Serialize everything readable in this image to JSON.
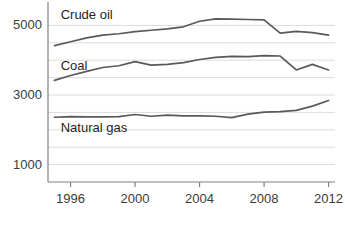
{
  "chart_data": {
    "type": "line",
    "title": "",
    "subtitle": "",
    "xlabel": "",
    "ylabel": "",
    "xlim": [
      1994.6,
      2012.4
    ],
    "ylim": [
      500,
      5500
    ],
    "xticks": [
      1996,
      2000,
      2004,
      2008,
      2012
    ],
    "xtick_labels": [
      "1996",
      "2000",
      "2004",
      "2008",
      "2012"
    ],
    "yticks": [
      1000,
      3000,
      5000
    ],
    "ytick_labels": [
      "1000",
      "3000",
      "5000"
    ],
    "gridlines_y": [
      1000,
      1500,
      2000,
      2500,
      3000,
      3500,
      4000,
      4500,
      5000
    ],
    "grid": true,
    "grid_color": "#dcdcdc",
    "legend": "inline-labels",
    "legend_position": "inside-left",
    "axis_color": "#808080",
    "line_color": "#595959",
    "background": "#ffffff",
    "x": [
      1995,
      1996,
      1997,
      1998,
      1999,
      2000,
      2001,
      2002,
      2003,
      2004,
      2005,
      2006,
      2007,
      2008,
      2009,
      2010,
      2011,
      2012
    ],
    "series": [
      {
        "name": "Crude oil",
        "label": "Crude oil",
        "values": [
          4420,
          4530,
          4640,
          4720,
          4760,
          4820,
          4860,
          4900,
          4960,
          5120,
          5190,
          5180,
          5170,
          5160,
          4780,
          4830,
          4790,
          4720
        ]
      },
      {
        "name": "Coal",
        "label": "Coal",
        "values": [
          3420,
          3560,
          3680,
          3790,
          3840,
          3960,
          3860,
          3880,
          3930,
          4020,
          4080,
          4110,
          4100,
          4130,
          4120,
          3720,
          3880,
          3720
        ]
      },
      {
        "name": "Natural gas",
        "label": "Natural gas",
        "values": [
          2360,
          2380,
          2370,
          2370,
          2380,
          2440,
          2390,
          2420,
          2400,
          2400,
          2390,
          2350,
          2450,
          2510,
          2520,
          2560,
          2680,
          2840
        ]
      }
    ],
    "annotations": [
      {
        "text": "Crude oil",
        "x": 1995.2,
        "y": 5290
      },
      {
        "text": "Coal",
        "x": 1995.2,
        "y": 3830
      },
      {
        "text": "Natural gas",
        "x": 1995.2,
        "y": 2060
      }
    ]
  }
}
